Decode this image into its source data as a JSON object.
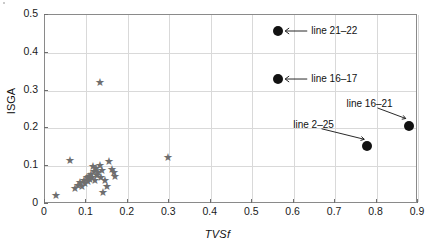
{
  "chart_data": {
    "type": "scatter",
    "title": "",
    "xlabel": "TVSf",
    "ylabel": "ISGA",
    "xlim": [
      0,
      0.9
    ],
    "ylim": [
      0,
      0.5
    ],
    "xticks": [
      "0",
      "0.1",
      "0.2",
      "0.3",
      "0.4",
      "0.5",
      "0.6",
      "0.7",
      "0.8",
      "0.9"
    ],
    "yticks": [
      "0",
      "0.1",
      "0.2",
      "0.3",
      "0.4",
      "0.5"
    ],
    "grid": true,
    "legend": "none",
    "series": [
      {
        "name": "unlabeled-samples",
        "marker": "star",
        "color": "#6e6e6e",
        "points": [
          [
            0.028,
            0.02
          ],
          [
            0.062,
            0.115
          ],
          [
            0.075,
            0.04
          ],
          [
            0.082,
            0.048
          ],
          [
            0.088,
            0.055
          ],
          [
            0.092,
            0.045
          ],
          [
            0.096,
            0.06
          ],
          [
            0.1,
            0.052
          ],
          [
            0.103,
            0.068
          ],
          [
            0.106,
            0.058
          ],
          [
            0.109,
            0.072
          ],
          [
            0.112,
            0.063
          ],
          [
            0.114,
            0.078
          ],
          [
            0.117,
            0.07
          ],
          [
            0.12,
            0.085
          ],
          [
            0.122,
            0.062
          ],
          [
            0.125,
            0.092
          ],
          [
            0.128,
            0.075
          ],
          [
            0.118,
            0.098
          ],
          [
            0.131,
            0.082
          ],
          [
            0.134,
            0.1
          ],
          [
            0.135,
            0.32
          ],
          [
            0.138,
            0.07
          ],
          [
            0.141,
            0.088
          ],
          [
            0.143,
            0.03
          ],
          [
            0.147,
            0.06
          ],
          [
            0.152,
            0.045
          ],
          [
            0.158,
            0.112
          ],
          [
            0.163,
            0.09
          ],
          [
            0.168,
            0.082
          ],
          [
            0.172,
            0.072
          ],
          [
            0.3,
            0.123
          ]
        ]
      },
      {
        "name": "highlighted-lines",
        "marker": "circle",
        "color": "#121212",
        "points": [
          {
            "x": 0.565,
            "y": 0.455,
            "label": "line 21–22"
          },
          {
            "x": 0.565,
            "y": 0.328,
            "label": "line 16–17"
          },
          {
            "x": 0.78,
            "y": 0.15,
            "label": "line 2–25"
          },
          {
            "x": 0.88,
            "y": 0.205,
            "label": "line 16–21"
          }
        ]
      }
    ],
    "annotations": [
      {
        "text": "line 21–22",
        "point": [
          0.565,
          0.455
        ],
        "text_x": 0.64,
        "text_y": 0.455
      },
      {
        "text": "line 16–17",
        "point": [
          0.565,
          0.328
        ],
        "text_x": 0.64,
        "text_y": 0.328
      },
      {
        "text": "line 2–25",
        "point": [
          0.78,
          0.15
        ],
        "text_x": 0.66,
        "text_y": 0.207
      },
      {
        "text": "line 16–21",
        "point": [
          0.88,
          0.205
        ],
        "text_x": 0.795,
        "text_y": 0.262
      }
    ]
  }
}
